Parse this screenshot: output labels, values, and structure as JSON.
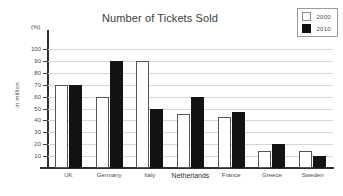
{
  "chart_data": {
    "type": "bar",
    "title": "Number of Tickets Sold",
    "xlabel": "",
    "ylabel": "in million",
    "unit_note": "(%)",
    "categories": [
      "UK",
      "Germany",
      "Italy",
      "Netherlands",
      "France",
      "Greece",
      "Sweden"
    ],
    "series": [
      {
        "name": "2000",
        "values": [
          70,
          60,
          90,
          45,
          43,
          14,
          14
        ]
      },
      {
        "name": "2010",
        "values": [
          70,
          90,
          50,
          60,
          47,
          20,
          10
        ]
      }
    ],
    "ylim": [
      0,
      100
    ],
    "yticks": [
      10,
      20,
      30,
      40,
      50,
      60,
      70,
      80,
      90,
      100
    ],
    "ytick_labels": [
      "10",
      "20",
      "30",
      "40",
      "50",
      "60",
      "70",
      "80",
      "90",
      "100"
    ],
    "grid": true,
    "legend_position": "top-right",
    "colors": {
      "series_2000_fill": "#ffffff",
      "series_2000_stroke": "#555555",
      "series_2010_fill": "#131313",
      "gridline": "#d7d7d7",
      "axis": "#2f2f2f",
      "text": "#4a4a4a",
      "background": "#ffffff"
    }
  },
  "legend": {
    "items": [
      {
        "label": "2000"
      },
      {
        "label": "2010"
      }
    ]
  }
}
